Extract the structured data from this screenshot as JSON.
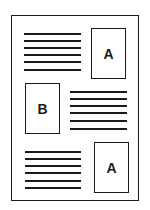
{
  "diagram": {
    "type": "page-layout",
    "boxes": [
      {
        "label": "A",
        "position": "top-right"
      },
      {
        "label": "B",
        "position": "middle-left"
      },
      {
        "label": "A",
        "position": "bottom-right"
      }
    ],
    "text_blocks": [
      {
        "position": "top-left",
        "line_count": 6
      },
      {
        "position": "middle-right",
        "line_count": 6
      },
      {
        "position": "bottom-left",
        "line_count": 6
      }
    ]
  }
}
